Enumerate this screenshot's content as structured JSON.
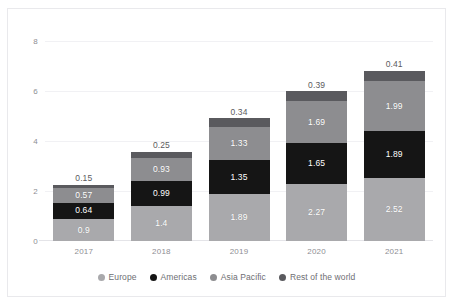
{
  "chart_data": {
    "type": "bar",
    "stacked": true,
    "title": "",
    "subtitle": "",
    "xlabel": "",
    "ylabel": "",
    "categories": [
      "2017",
      "2018",
      "2019",
      "2020",
      "2021"
    ],
    "series": [
      {
        "name": "Europe",
        "color": "#a9a9ac",
        "values": [
          0.9,
          1.4,
          1.89,
          2.27,
          2.52
        ],
        "labels": [
          "0.9",
          "1.4",
          "1.89",
          "2.27",
          "2.52"
        ]
      },
      {
        "name": "Americas",
        "color": "#151515",
        "values": [
          0.64,
          0.99,
          1.35,
          1.65,
          1.89
        ],
        "labels": [
          "0.64",
          "0.99",
          "1.35",
          "1.65",
          "1.89"
        ]
      },
      {
        "name": "Asia Pacific",
        "color": "#8d8d90",
        "values": [
          0.57,
          0.93,
          1.33,
          1.69,
          1.99
        ],
        "labels": [
          "0.57",
          "0.93",
          "1.33",
          "1.69",
          "1.99"
        ]
      },
      {
        "name": "Rest of the world",
        "color": "#5a5a5e",
        "values": [
          0.15,
          0.25,
          0.34,
          0.39,
          0.41
        ],
        "labels": [
          "0.15",
          "0.25",
          "0.34",
          "0.39",
          "0.41"
        ]
      }
    ],
    "totals": [
      2.26,
      3.57,
      4.91,
      6.0,
      6.81
    ],
    "yticks": [
      "0",
      "2",
      "4",
      "6",
      "8"
    ],
    "ytick_values": [
      0,
      2,
      4,
      6,
      8
    ],
    "ylim": [
      0,
      8.4
    ],
    "grid": true,
    "legend_position": "bottom",
    "legend": [
      "Europe",
      "Americas",
      "Asia Pacific",
      "Rest of the world"
    ]
  },
  "colors": {
    "europe": "#a9a9ac",
    "americas": "#151515",
    "asia_pacific": "#8d8d90",
    "rest_of_world": "#5a5a5e",
    "gridline": "#f1f1f4",
    "axis": "#e4e4e8",
    "tick_text": "#8e8e93",
    "legend_text": "#6e6e73",
    "frame": "#e9e9ec",
    "background": "#ffffff"
  }
}
